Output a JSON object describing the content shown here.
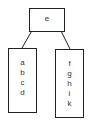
{
  "diagram": {
    "root": {
      "label": "e"
    },
    "children": [
      {
        "items": [
          "a",
          "b",
          "c",
          "d"
        ]
      },
      {
        "items": [
          "f",
          "g",
          "h",
          "i",
          "k"
        ]
      }
    ],
    "colors": {
      "stroke": "#222222",
      "text": "#333333",
      "background": "#ffffff"
    }
  }
}
